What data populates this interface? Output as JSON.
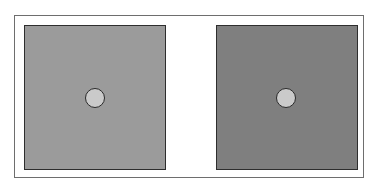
{
  "figure": {
    "frame_border_color": "#6e6e6e",
    "panels": [
      {
        "name": "left-panel",
        "background_color": "#9b9b9b",
        "circle_color": "#cacaca"
      },
      {
        "name": "right-panel",
        "background_color": "#7f7f7f",
        "circle_color": "#cacaca"
      }
    ]
  }
}
